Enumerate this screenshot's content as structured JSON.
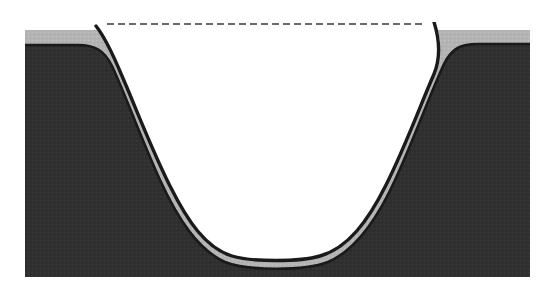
{
  "figure": {
    "title": "Cross-section of an etched trench with conformal liner film",
    "type": "technical-cross-section-diagram",
    "caption": "",
    "width": 537,
    "height": 296,
    "background_color": "#ffffff"
  },
  "colors": {
    "substrate_fill": "#333333",
    "liner_fill": "#b3b3b3",
    "void_fill": "#ffffff",
    "outline_stroke": "#1a1a1a",
    "reference_line_stroke": "#3a3a3a",
    "page_background": "#ffffff"
  },
  "layers": [
    {
      "id": "substrate",
      "name": "substrate",
      "label": "",
      "fill": "#333333",
      "description": "dark halftone bulk material forming the body of the block"
    },
    {
      "id": "liner",
      "name": "conformal-liner-film",
      "label": "",
      "fill": "#b3b3b3",
      "thickness_px": 12,
      "description": "light gray conformal film covering the top surface and lining the trench walls and bottom"
    },
    {
      "id": "trench-void",
      "name": "trench-void",
      "label": "",
      "fill": "#ffffff",
      "description": "open unfilled trench cavity"
    }
  ],
  "reference_line": {
    "name": "original-surface-reference-line",
    "label": "",
    "style": "dashed",
    "dash_pattern": "7 4",
    "stroke": "#3a3a3a",
    "stroke_width": 1.6,
    "y": 24,
    "x_start": 107,
    "x_end": 424
  },
  "geometry": {
    "block_left": 25,
    "block_right": 530,
    "block_top": 30,
    "block_bottom": 277,
    "substrate_top": 45,
    "trench_opening_left": 105,
    "trench_opening_right": 425,
    "trench_bottom_y": 256,
    "trench_midwall_left_x": 140,
    "trench_midwall_right_x": 365,
    "left_tip_x": 96,
    "left_tip_y": 26,
    "right_tip_x": 434,
    "right_tip_y": 22
  },
  "annotations": []
}
